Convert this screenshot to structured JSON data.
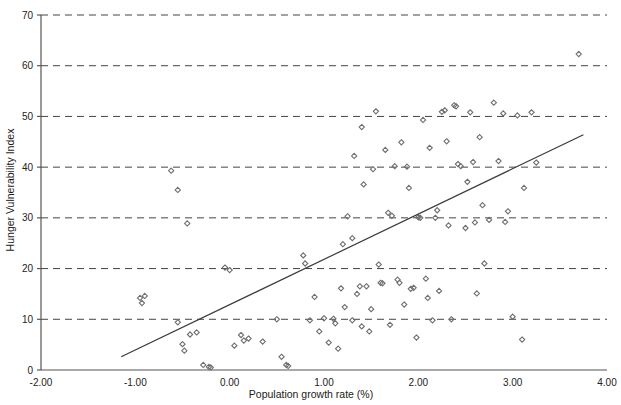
{
  "chart_data": {
    "type": "scatter",
    "title": "",
    "xlabel": "Population growth rate (%)",
    "ylabel": "Hunger Vulnerability Index",
    "xlim": [
      -2.0,
      4.0
    ],
    "ylim": [
      0,
      70
    ],
    "xticks": [
      "-2.00",
      "-1.00",
      "0.00",
      "1.00",
      "2.00",
      "3.00",
      "4.00"
    ],
    "xtick_values": [
      -2.0,
      -1.0,
      0.0,
      1.0,
      2.0,
      3.0,
      4.0
    ],
    "yticks": [
      "0",
      "10",
      "20",
      "30",
      "40",
      "50",
      "60",
      "70"
    ],
    "ytick_values": [
      0,
      10,
      20,
      30,
      40,
      50,
      60,
      70
    ],
    "grid": "horizontal-dashed",
    "legend": "none",
    "marker": "diamond",
    "marker_color": "#6e6e6e",
    "line_color": "#3a3a3a",
    "axis_color": "#555555",
    "grid_color": "#444444",
    "trendline": {
      "type": "linear",
      "x_start": -1.15,
      "y_start": 2.6,
      "x_end": 3.75,
      "y_end": 46.4
    },
    "points": [
      [
        -0.95,
        14.2
      ],
      [
        -0.93,
        13.2
      ],
      [
        -0.9,
        14.6
      ],
      [
        -0.62,
        39.3
      ],
      [
        -0.55,
        35.5
      ],
      [
        -0.55,
        9.4
      ],
      [
        -0.5,
        5.1
      ],
      [
        -0.48,
        3.8
      ],
      [
        -0.45,
        28.9
      ],
      [
        -0.42,
        7.0
      ],
      [
        -0.35,
        7.4
      ],
      [
        -0.28,
        1.0
      ],
      [
        -0.22,
        0.6
      ],
      [
        -0.2,
        0.5
      ],
      [
        -0.05,
        20.2
      ],
      [
        0.0,
        19.7
      ],
      [
        0.05,
        4.8
      ],
      [
        0.12,
        6.9
      ],
      [
        0.15,
        5.8
      ],
      [
        0.2,
        6.2
      ],
      [
        0.35,
        5.6
      ],
      [
        0.5,
        10.0
      ],
      [
        0.55,
        2.6
      ],
      [
        0.6,
        1.0
      ],
      [
        0.62,
        0.8
      ],
      [
        0.78,
        22.6
      ],
      [
        0.8,
        21.0
      ],
      [
        0.85,
        9.8
      ],
      [
        0.9,
        14.4
      ],
      [
        0.95,
        7.6
      ],
      [
        1.0,
        10.2
      ],
      [
        1.05,
        5.4
      ],
      [
        1.1,
        10.1
      ],
      [
        1.12,
        9.2
      ],
      [
        1.15,
        4.2
      ],
      [
        1.18,
        16.1
      ],
      [
        1.2,
        24.8
      ],
      [
        1.22,
        12.4
      ],
      [
        1.25,
        30.3
      ],
      [
        1.3,
        26.0
      ],
      [
        1.3,
        9.8
      ],
      [
        1.32,
        42.2
      ],
      [
        1.35,
        15.0
      ],
      [
        1.38,
        16.5
      ],
      [
        1.4,
        8.6
      ],
      [
        1.4,
        47.9
      ],
      [
        1.42,
        36.6
      ],
      [
        1.45,
        16.5
      ],
      [
        1.48,
        7.6
      ],
      [
        1.5,
        12.0
      ],
      [
        1.52,
        39.6
      ],
      [
        1.55,
        51.0
      ],
      [
        1.58,
        20.8
      ],
      [
        1.6,
        17.2
      ],
      [
        1.62,
        17.1
      ],
      [
        1.65,
        43.4
      ],
      [
        1.68,
        31.0
      ],
      [
        1.7,
        8.9
      ],
      [
        1.72,
        30.4
      ],
      [
        1.75,
        40.2
      ],
      [
        1.78,
        17.8
      ],
      [
        1.8,
        17.2
      ],
      [
        1.82,
        44.9
      ],
      [
        1.85,
        12.9
      ],
      [
        1.88,
        40.1
      ],
      [
        1.9,
        35.9
      ],
      [
        1.92,
        16.0
      ],
      [
        1.95,
        16.2
      ],
      [
        1.98,
        6.4
      ],
      [
        2.0,
        30.1
      ],
      [
        2.02,
        30.0
      ],
      [
        2.05,
        49.3
      ],
      [
        2.08,
        18.0
      ],
      [
        2.1,
        14.2
      ],
      [
        2.12,
        43.8
      ],
      [
        2.15,
        9.8
      ],
      [
        2.18,
        30.0
      ],
      [
        2.2,
        31.5
      ],
      [
        2.22,
        15.6
      ],
      [
        2.25,
        50.9
      ],
      [
        2.28,
        51.2
      ],
      [
        2.3,
        45.1
      ],
      [
        2.32,
        28.5
      ],
      [
        2.35,
        10.0
      ],
      [
        2.38,
        52.2
      ],
      [
        2.4,
        52.0
      ],
      [
        2.42,
        40.6
      ],
      [
        2.45,
        40.2
      ],
      [
        2.5,
        28.0
      ],
      [
        2.52,
        37.1
      ],
      [
        2.55,
        50.8
      ],
      [
        2.58,
        41.0
      ],
      [
        2.6,
        29.1
      ],
      [
        2.62,
        15.1
      ],
      [
        2.65,
        45.9
      ],
      [
        2.68,
        32.5
      ],
      [
        2.7,
        21.0
      ],
      [
        2.75,
        29.6
      ],
      [
        2.8,
        52.7
      ],
      [
        2.85,
        41.2
      ],
      [
        2.9,
        50.6
      ],
      [
        2.92,
        29.2
      ],
      [
        2.95,
        31.3
      ],
      [
        3.0,
        10.5
      ],
      [
        3.05,
        50.2
      ],
      [
        3.1,
        6.0
      ],
      [
        3.12,
        35.9
      ],
      [
        3.2,
        50.8
      ],
      [
        3.25,
        40.9
      ],
      [
        3.7,
        62.3
      ]
    ]
  }
}
